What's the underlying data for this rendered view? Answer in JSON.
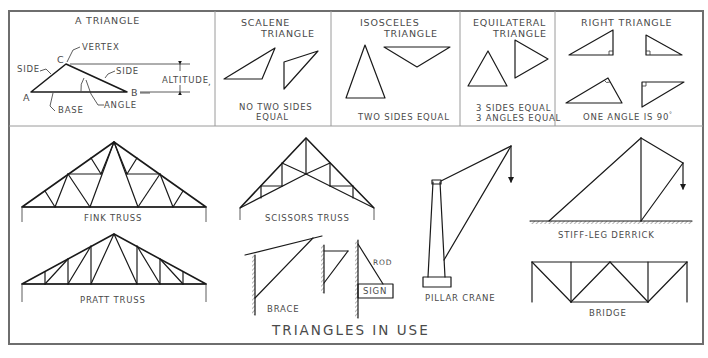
{
  "figure": {
    "width": 708,
    "height": 358,
    "ink_color": "#1a1a1a",
    "label_color": "#4a4a4a",
    "frame_color": "#6e6e6e"
  },
  "top_panels": {
    "a_triangle": {
      "title": "A TRIANGLE",
      "labels": {
        "vertex": "VERTEX",
        "vertex_letter": "C",
        "side_left": "SIDE",
        "side_right": "SIDE",
        "altitude": "ALTITUDE",
        "point_a": "A",
        "point_b": "B",
        "base": "BASE",
        "angle": "ANGLE"
      }
    },
    "scalene": {
      "title_line1": "SCALENE",
      "title_line2": "TRIANGLE",
      "caption_line1": "NO TWO SIDES",
      "caption_line2": "EQUAL"
    },
    "isosceles": {
      "title_line1": "ISOSCELES",
      "title_line2": "TRIANGLE",
      "caption": "TWO SIDES EQUAL"
    },
    "equilateral": {
      "title_line1": "EQUILATERAL",
      "title_line2": "TRIANGLE",
      "caption_line1": "3  SIDES EQUAL",
      "caption_line2": "3  ANGLES EQUAL"
    },
    "right": {
      "title": "RIGHT TRIANGLE",
      "caption": "ONE ANGLE IS 90",
      "degree_mark": "°"
    }
  },
  "triangles_in_use": {
    "section_title": "TRIANGLES IN USE",
    "items": [
      {
        "id": "fink-truss",
        "label": "FINK TRUSS"
      },
      {
        "id": "pratt-truss",
        "label": "PRATT TRUSS"
      },
      {
        "id": "scissors-truss",
        "label": "SCISSORS TRUSS"
      },
      {
        "id": "brace",
        "label": "BRACE"
      },
      {
        "id": "rod",
        "label": "ROD"
      },
      {
        "id": "sign",
        "label": "SIGN"
      },
      {
        "id": "pillar-crane",
        "label": "PILLAR CRANE"
      },
      {
        "id": "stiff-leg-derrick",
        "label": "STIFF-LEG DERRICK"
      },
      {
        "id": "bridge",
        "label": "BRIDGE"
      }
    ]
  }
}
